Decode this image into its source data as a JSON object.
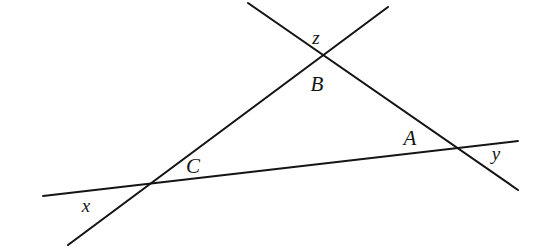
{
  "figure": {
    "kind": "geometry-line-diagram",
    "background_color": "#ffffff",
    "stroke_color": "#141414",
    "width": 537,
    "height": 251
  },
  "lines": [
    {
      "id": "line-x-y",
      "name": "near-horizontal-line",
      "x1": 43,
      "y1": 196,
      "x2": 518,
      "y2": 141,
      "stroke_width": 1.9
    },
    {
      "id": "line-x-z",
      "name": "rising-line",
      "x1": 68,
      "y1": 245,
      "x2": 388,
      "y2": 7,
      "stroke_width": 2.1
    },
    {
      "id": "line-z-y",
      "name": "descending-line",
      "x1": 248,
      "y1": 3,
      "x2": 518,
      "y2": 190,
      "stroke_width": 2.1
    }
  ],
  "vertices": [
    {
      "id": "vertex-b",
      "x": 315,
      "y": 57
    },
    {
      "id": "vertex-c",
      "x": 138,
      "y": 184
    },
    {
      "id": "vertex-a",
      "x": 453,
      "y": 146
    }
  ],
  "labels": [
    {
      "id": "label-z",
      "text": "z",
      "x": 316,
      "y": 40,
      "style": "lowercase"
    },
    {
      "id": "label-b",
      "text": "B",
      "x": 317,
      "y": 86,
      "style": "uppercase"
    },
    {
      "id": "label-a",
      "text": "A",
      "x": 410,
      "y": 140,
      "style": "uppercase"
    },
    {
      "id": "label-y",
      "text": "y",
      "x": 496,
      "y": 156,
      "style": "lowercase"
    },
    {
      "id": "label-c",
      "text": "C",
      "x": 193,
      "y": 168,
      "style": "uppercase"
    },
    {
      "id": "label-x",
      "text": "x",
      "x": 86,
      "y": 208,
      "style": "lowercase"
    }
  ]
}
